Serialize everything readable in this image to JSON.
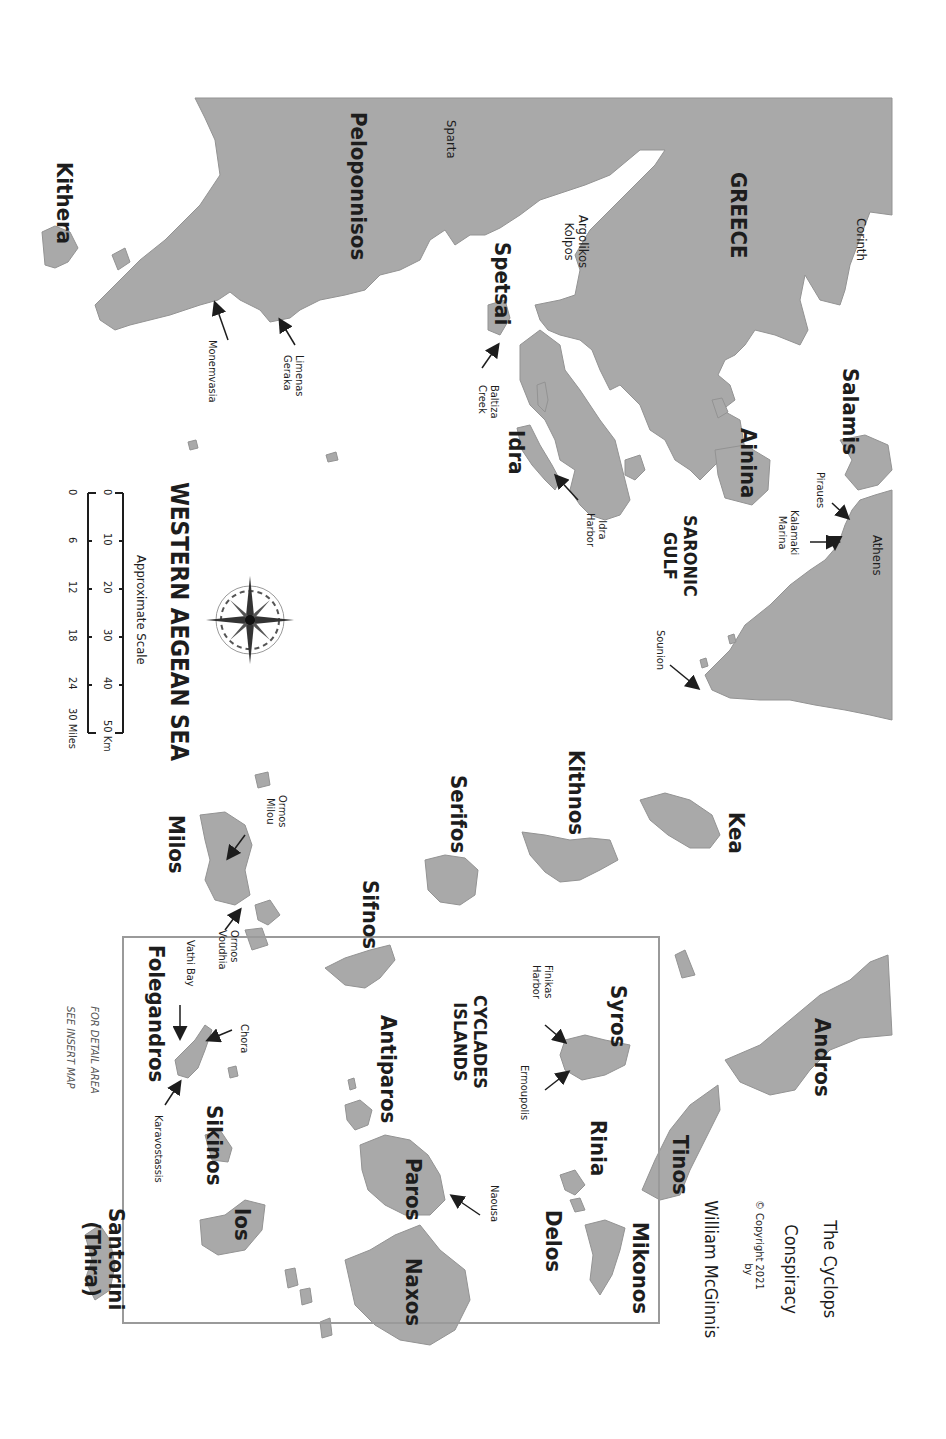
{
  "map": {
    "title": "WESTERN AEGEAN SEA",
    "book_title_line1": "The Cyclops",
    "book_title_line2": "Conspiracy",
    "book_by": "by",
    "book_author": "William McGinnis",
    "copyright": "© Copyright 2021",
    "inset_note_line1": "FOR DETAIL AREA",
    "inset_note_line2": "SEE INSERT MAP",
    "orientation": "rotated 90° clockwise"
  },
  "scale": {
    "label": "Approximate Scale",
    "km_ticks": [
      "0",
      "10",
      "20",
      "30",
      "40",
      "50 Km"
    ],
    "mile_ticks": [
      "0",
      "6",
      "12",
      "18",
      "24",
      "30 Miles"
    ]
  },
  "compass": {
    "n": "N",
    "s": "S",
    "e": "E",
    "w": "W"
  },
  "regions": {
    "greece": "GREECE",
    "peloponnisos": "Peloponnisos",
    "saronic_gulf_1": "SARONIC",
    "saronic_gulf_2": "GULF",
    "cyclades_1": "CYCLADES",
    "cyclades_2": "ISLANDS",
    "argolikos_1": "Argolikos",
    "argolikos_2": "Kolpos"
  },
  "cities": {
    "corinth": "Corinth",
    "sparta": "Sparta",
    "athens": "Athens",
    "piraues": "Piraues",
    "kalamaki_1": "Kalamaki",
    "kalamaki_2": "Marina",
    "sounion": "Sounion",
    "idra_harbor_1": "Idra",
    "idra_harbor_2": "Harbor",
    "baltiza_1": "Baltiza",
    "baltiza_2": "Creek",
    "limenas_1": "Limenas",
    "limenas_2": "Geraka",
    "monemvasia": "Monemvasia",
    "ormos_milou_1": "Ormos",
    "ormos_milou_2": "Milou",
    "ormos_voudhia_1": "Ormos",
    "ormos_voudhia_2": "Voudhia",
    "vathi_bay": "Vathi Bay",
    "chora": "Chora",
    "karavostassis": "Karavostassis",
    "finikas_1": "Finikas",
    "finikas_2": "Harbor",
    "ermoupolis": "Ermoupolis",
    "naousa": "Naousa"
  },
  "islands": {
    "kithera": "Kithera",
    "spetsai": "Spetsai",
    "idra": "Idra",
    "ainina": "Ainina",
    "salamis": "Salamis",
    "kea": "Kea",
    "kithnos": "Kithnos",
    "serifos": "Serifos",
    "sifnos": "Sifnos",
    "milos": "Milos",
    "folegandros": "Folegandros",
    "sikinos": "Sikinos",
    "ios": "Ios",
    "santorini_1": "Santorini",
    "santorini_2": "(Thira)",
    "antiparos": "Antiparos",
    "paros": "Paros",
    "naxos": "Naxos",
    "syros": "Syros",
    "rinia": "Rinia",
    "delos": "Delos",
    "mikonos": "Mikonos",
    "tinos": "Tinos",
    "andros": "Andros"
  },
  "colors": {
    "land": "#a9a9a9",
    "sea": "#ffffff",
    "text": "#1d1d1d",
    "inset_border": "#9a9a9a"
  }
}
